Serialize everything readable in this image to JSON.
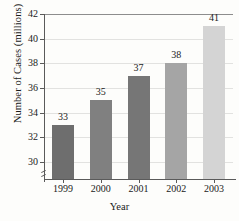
{
  "chart_data": {
    "type": "bar",
    "title": "",
    "xlabel": "Year",
    "ylabel": "Number of Cases (millions)",
    "categories": [
      "1999",
      "2000",
      "2001",
      "2002",
      "2003"
    ],
    "values": [
      33,
      35,
      37,
      38,
      41
    ],
    "value_labels": [
      "33",
      "35",
      "37",
      "38",
      "41"
    ],
    "ylim": [
      28.6,
      42
    ],
    "yticks": [
      30,
      32,
      34,
      36,
      38,
      40,
      42
    ],
    "ytick_labels": [
      "30",
      "32",
      "34",
      "36",
      "38",
      "40",
      "42"
    ],
    "grid": true,
    "grid_axis": "y",
    "legend": false,
    "axis_break": true,
    "bar_colors": [
      "#6e6e6e",
      "#808080",
      "#767676",
      "#a5a5a5",
      "#d4d4d4"
    ],
    "background": "#fdfdfb",
    "axis_color": "#5a5a5a",
    "grid_color": "#e2e2e0",
    "text_color": "#1a1a1a"
  }
}
